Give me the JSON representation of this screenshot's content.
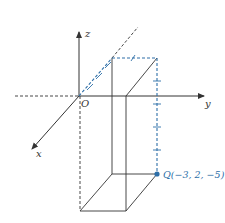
{
  "diagram": {
    "type": "3d-coordinate-plot",
    "axes": {
      "x_label": "x",
      "y_label": "y",
      "z_label": "z",
      "origin_label": "O"
    },
    "point": {
      "name": "Q",
      "label": "Q(−3, 2, −5)",
      "coords": [
        -3,
        2,
        -5
      ]
    },
    "colors": {
      "axis": "#333333",
      "accent": "#2e6fa8",
      "box": "#333333"
    }
  }
}
